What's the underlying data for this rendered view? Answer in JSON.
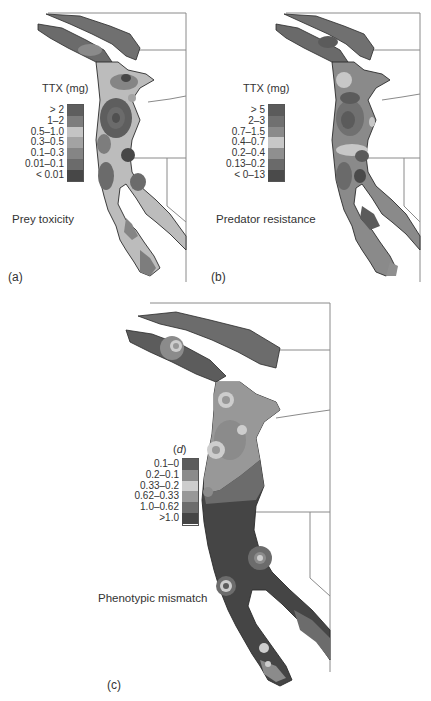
{
  "figure": {
    "panels": [
      {
        "id": "a",
        "letter": "(a)",
        "caption": "Prey toxicity",
        "legend": {
          "title": "TTX (mg)",
          "items": [
            {
              "label": "> 2",
              "color": "#5e5e5e"
            },
            {
              "label": "1–2",
              "color": "#7d7d7d"
            },
            {
              "label": "0.5–1.0",
              "color": "#c4c4c4"
            },
            {
              "label": "0.3–0.5",
              "color": "#a3a3a3"
            },
            {
              "label": "0.1–0.3",
              "color": "#858585"
            },
            {
              "label": "0.01–0.1",
              "color": "#6b6b6b"
            },
            {
              "label": "< 0.01",
              "color": "#474747"
            }
          ]
        }
      },
      {
        "id": "b",
        "letter": "(b)",
        "caption": "Predator resistance",
        "legend": {
          "title": "TTX (mg)",
          "items": [
            {
              "label": "> 5",
              "color": "#5b5b5b"
            },
            {
              "label": "2–3",
              "color": "#707070"
            },
            {
              "label": "0.7–1.5",
              "color": "#8a8a8a"
            },
            {
              "label": "0.4–0.7",
              "color": "#c7c7c7"
            },
            {
              "label": "0.2–0.4",
              "color": "#8f8f8f"
            },
            {
              "label": "0.13–0.2",
              "color": "#6a6a6a"
            },
            {
              "label": "< 0–13",
              "color": "#4a4a4a"
            }
          ]
        }
      },
      {
        "id": "c",
        "letter": "(c)",
        "caption": "Phenotypic mismatch",
        "legend": {
          "title_prefix": "(",
          "title_var": "d",
          "title_suffix": ")",
          "items": [
            {
              "label": "0.1–0",
              "color": "#5c5c5c"
            },
            {
              "label": "0.2–0.1",
              "color": "#8b8b8b"
            },
            {
              "label": "0.33–0.2",
              "color": "#cdcdcd"
            },
            {
              "label": "0.62–0.33",
              "color": "#989898"
            },
            {
              "label": "1.0–0.62",
              "color": "#6c6c6c"
            },
            {
              ">1.0": null,
              "label": ">1.0",
              "color": "#454545"
            }
          ]
        }
      }
    ],
    "colors": {
      "border_line": "#8a8a8a",
      "coast_outline": "#2a2a2a",
      "background": "#ffffff"
    }
  }
}
